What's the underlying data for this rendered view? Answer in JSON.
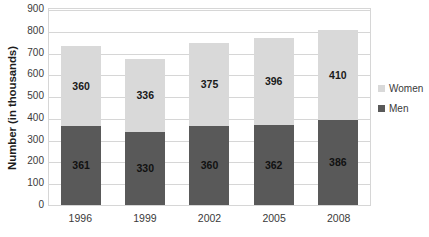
{
  "chart_data": {
    "type": "bar",
    "subtype": "stacked-bar",
    "title": "",
    "title_clipped": true,
    "xlabel": "",
    "ylabel": "Number (in thousands)",
    "categories": [
      "1996",
      "1999",
      "2002",
      "2005",
      "2008"
    ],
    "series": [
      {
        "name": "Men",
        "values": [
          361,
          330,
          360,
          362,
          386
        ],
        "color": "#595959"
      },
      {
        "name": "Women",
        "values": [
          360,
          336,
          375,
          396,
          410
        ],
        "color": "#D9D9D9"
      }
    ],
    "totals": [
      721,
      666,
      735,
      758,
      796
    ],
    "ylim": [
      0,
      900
    ],
    "ytick_step": 100,
    "yticks": [
      "900",
      "800",
      "700",
      "600",
      "500",
      "400",
      "300",
      "200",
      "100",
      "0"
    ],
    "grid": "horizontal",
    "legend_position": "right",
    "data_labels": true
  },
  "legend": {
    "items": [
      {
        "label": "Women",
        "key": "women"
      },
      {
        "label": "Men",
        "key": "men"
      }
    ]
  },
  "colors": {
    "men": "#595959",
    "women": "#D9D9D9",
    "gridline": "#D6D6D6",
    "plot_border": "#D6D6D6",
    "text": "#3A3A3A",
    "background": "#FFFFFF"
  }
}
